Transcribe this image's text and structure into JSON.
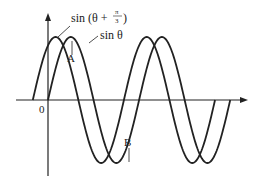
{
  "diagram": {
    "curves": [
      {
        "name": "sin θ",
        "label": "sin θ",
        "phase": 0
      },
      {
        "name": "sin(θ + π/3)",
        "label_main": "sin (θ +",
        "label_frac_num": "π",
        "label_frac_den": "3",
        "label_close": ")",
        "phase": 1.0471975512
      }
    ],
    "origin_label": "0",
    "points": [
      {
        "name": "A",
        "label": "A"
      },
      {
        "name": "B",
        "label": "B"
      }
    ],
    "theta_range": [
      -1.0471975512,
      9.4247779608
    ],
    "amplitude": 1,
    "stroke_color": "#222222"
  }
}
